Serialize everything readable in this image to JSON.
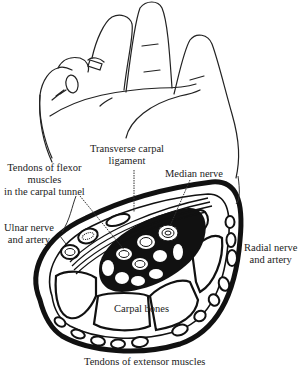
{
  "figure": {
    "labels": {
      "transverse_carpal_ligament_1": "Transverse carpal",
      "transverse_carpal_ligament_2": "ligament",
      "median_nerve": "Median nerve",
      "tendons_flexor_1": "Tendons of flexor",
      "tendons_flexor_2": "muscles",
      "tendons_flexor_3": "in the carpal tunnel",
      "ulnar_1": "Ulnar nerve",
      "ulnar_2": "and artery",
      "radial_1": "Radial nerve",
      "radial_2": "and artery",
      "carpal_bones": "Carpal bones",
      "tendons_extensor": "Tendons of extensor muscles"
    },
    "colors": {
      "ink": "#111111",
      "background": "#ffffff"
    }
  }
}
